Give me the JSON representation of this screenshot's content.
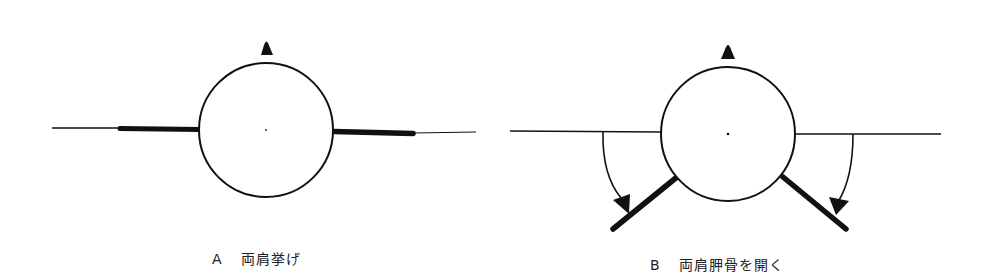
{
  "figure": {
    "panels": [
      {
        "id": "A",
        "letter": "A",
        "caption": "両肩挙げ",
        "head": {
          "cx": 266,
          "cy": 130,
          "r": 67
        },
        "nose_marker": "triangle-up",
        "left_arm": {
          "thin": [
            52,
            128,
            120,
            128
          ],
          "thick": [
            120,
            128,
            200,
            130
          ]
        },
        "right_arm": {
          "thick": [
            334,
            131,
            413,
            134
          ],
          "thin": [
            413,
            134,
            476,
            132
          ]
        }
      },
      {
        "id": "B",
        "letter": "B",
        "caption": "両肩胛骨を開く",
        "head": {
          "cx": 728,
          "cy": 134,
          "r": 67
        },
        "nose_marker": "triangle-up",
        "left_reference_line": [
          510,
          131,
          661,
          132
        ],
        "right_reference_line": [
          795,
          134,
          941,
          134
        ],
        "left_blade": [
          677,
          177,
          613,
          230
        ],
        "right_blade": [
          783,
          177,
          846,
          230
        ],
        "left_rotation_arrow": "clockwise-down",
        "right_rotation_arrow": "counterclockwise-down"
      }
    ],
    "colors": {
      "stroke": "#111111",
      "background": "#ffffff"
    }
  }
}
